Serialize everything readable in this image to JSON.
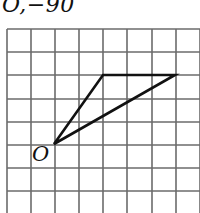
{
  "caption": {
    "text": "O,−90"
  },
  "diagram": {
    "type": "grid-figure",
    "grid": {
      "columns_visible": 8,
      "rows_visible": 8,
      "cell_size_px": 24,
      "line_color": "#6b6b6b"
    },
    "origin_label": "O",
    "triangle": {
      "vertices": [
        {
          "name": "O",
          "grid": [
            0,
            0
          ]
        },
        {
          "name": "A",
          "grid": [
            2,
            3
          ]
        },
        {
          "name": "B",
          "grid": [
            5,
            3
          ]
        }
      ],
      "stroke_color": "#111111"
    }
  }
}
